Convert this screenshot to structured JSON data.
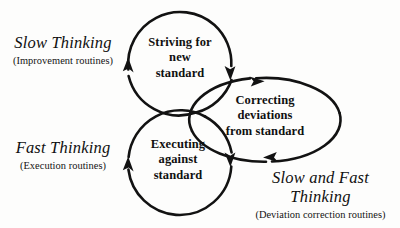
{
  "diagram": {
    "stroke_color": "#121212",
    "background_color": "#fdfdfc",
    "nodes": [
      {
        "id": "striving",
        "shape": "circle",
        "label_lines": [
          "Striving for",
          "new",
          "standard"
        ],
        "line1": "Striving for",
        "line2": "new",
        "line3": "standard"
      },
      {
        "id": "correcting",
        "shape": "ellipse",
        "label_lines": [
          "Correcting",
          "deviations",
          "from standard"
        ],
        "line1": "Correcting",
        "line2": "deviations",
        "line3": "from standard"
      },
      {
        "id": "executing",
        "shape": "circle",
        "label_lines": [
          "Executing",
          "against",
          "standard"
        ],
        "line1": "Executing",
        "line2": "against",
        "line3": "standard"
      }
    ],
    "annotations": [
      {
        "id": "slow-thinking",
        "title": "Slow Thinking",
        "subtitle": "(Improvement routines)"
      },
      {
        "id": "fast-thinking",
        "title": "Fast Thinking",
        "subtitle": "(Execution routines)"
      },
      {
        "id": "slow-and-fast-thinking",
        "title": "Slow and Fast Thinking",
        "subtitle": "(Deviation correction routines)"
      }
    ],
    "arrows": [
      {
        "id": "striving-loop-left",
        "direction": "up"
      },
      {
        "id": "striving-loop-right",
        "direction": "down"
      },
      {
        "id": "correcting-loop-top",
        "direction": "right"
      },
      {
        "id": "correcting-loop-bottom",
        "direction": "left"
      },
      {
        "id": "executing-loop-left",
        "direction": "up"
      },
      {
        "id": "executing-loop-right",
        "direction": "down"
      }
    ]
  }
}
